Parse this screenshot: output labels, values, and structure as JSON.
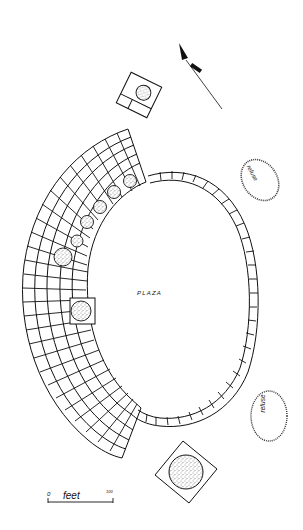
{
  "figure": {
    "type": "archaeological site plan",
    "labels": {
      "plaza": "PLAZA",
      "refuse_north": "refuse",
      "refuse_south": "refuse"
    },
    "scale_bar": {
      "start": "0",
      "unit": "feet",
      "end": "100"
    },
    "north_arrow": {
      "symbol": "N",
      "direction": "north-northwest"
    },
    "features": [
      "plaza (oval)",
      "single row of rooms enclosing plaza on east",
      "multi-row room block arc on west",
      "kivas within room block (6)",
      "kiva in enclosure projecting into plaza",
      "detached kiva with rooms (north)",
      "great kiva in square enclosure (south)",
      "refuse mound (northeast)",
      "refuse mound (southeast)"
    ],
    "colors": {
      "ink": "#111111",
      "background": "#ffffff"
    }
  }
}
